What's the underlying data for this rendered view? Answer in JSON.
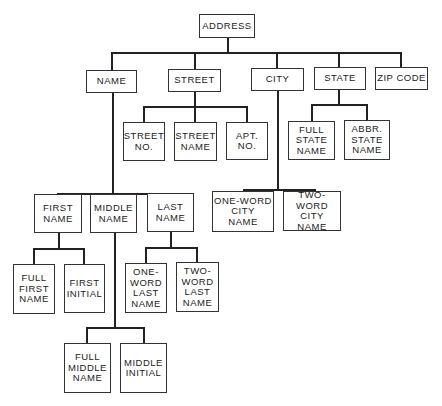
{
  "diagram": {
    "type": "hierarchy-tree",
    "root": "ADDRESS",
    "nodes": {
      "address": "ADDRESS",
      "name": "NAME",
      "street": "STREET",
      "city": "CITY",
      "state": "STATE",
      "zip_code": "ZIP CODE",
      "street_no": "STREET\nNO.",
      "street_name": "STREET\nNAME",
      "apt_no": "APT.\nNO.",
      "full_state_name": "FULL\nSTATE\nNAME",
      "abbr_state_name": "ABBR.\nSTATE\nNAME",
      "first_name": "FIRST\nNAME",
      "middle_name": "MIDDLE\nNAME",
      "last_name": "LAST\nNAME",
      "one_word_city_name": "ONE-WORD\nCITY\nNAME",
      "two_word_city_name": "TWO-WORD\nCITY\nNAME",
      "full_first_name": "FULL\nFIRST\nNAME",
      "first_initial": "FIRST\nINITIAL",
      "one_word_last_name": "ONE-\nWORD\nLAST\nNAME",
      "two_word_last_name": "TWO-\nWORD\nLAST\nNAME",
      "full_middle_name": "FULL\nMIDDLE\nNAME",
      "middle_initial": "MIDDLE\nINITIAL"
    },
    "edges": [
      [
        "ADDRESS",
        "NAME"
      ],
      [
        "ADDRESS",
        "STREET"
      ],
      [
        "ADDRESS",
        "CITY"
      ],
      [
        "ADDRESS",
        "STATE"
      ],
      [
        "ADDRESS",
        "ZIP CODE"
      ],
      [
        "STREET",
        "STREET NO."
      ],
      [
        "STREET",
        "STREET NAME"
      ],
      [
        "STREET",
        "APT. NO."
      ],
      [
        "STATE",
        "FULL STATE NAME"
      ],
      [
        "STATE",
        "ABBR. STATE NAME"
      ],
      [
        "NAME",
        "FIRST NAME"
      ],
      [
        "NAME",
        "MIDDLE NAME"
      ],
      [
        "NAME",
        "LAST NAME"
      ],
      [
        "CITY",
        "ONE-WORD CITY NAME"
      ],
      [
        "CITY",
        "TWO-WORD CITY NAME"
      ],
      [
        "FIRST NAME",
        "FULL FIRST NAME"
      ],
      [
        "FIRST NAME",
        "FIRST INITIAL"
      ],
      [
        "LAST NAME",
        "ONE-WORD LAST NAME"
      ],
      [
        "LAST NAME",
        "TWO-WORD LAST NAME"
      ],
      [
        "MIDDLE NAME",
        "FULL MIDDLE NAME"
      ],
      [
        "MIDDLE NAME",
        "MIDDLE INITIAL"
      ]
    ]
  }
}
